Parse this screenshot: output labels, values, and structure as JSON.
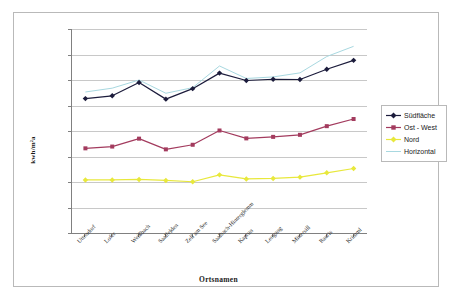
{
  "chart_data": {
    "type": "line",
    "title": "",
    "xlabel": "Ortsnamen",
    "ylabel": "kwh/m²a",
    "ylim": [
      0,
      800
    ],
    "ytick_step": 100,
    "yticks": [
      "0",
      "100",
      "200",
      "300",
      "400",
      "500",
      "600",
      "700",
      "800"
    ],
    "grid": true,
    "legend_position": "right",
    "categories": [
      "Uttendorf",
      "Lofer",
      "Weißbach",
      "Saalfelden",
      "Zell am See",
      "Saalbach-Hinterglemm",
      "Kaprun",
      "Leogang",
      "Mittersill",
      "Rauris",
      "Krimml"
    ],
    "series": [
      {
        "name": "Südfläche",
        "color": "#1c1c3c",
        "marker": "diamond",
        "values": [
          527,
          538,
          590,
          525,
          566,
          627,
          598,
          603,
          602,
          642,
          677
        ]
      },
      {
        "name": "Ost - West",
        "color": "#a33b5e",
        "marker": "square",
        "values": [
          332,
          339,
          370,
          328,
          346,
          402,
          371,
          377,
          385,
          419,
          447
        ]
      },
      {
        "name": "Nord",
        "color": "#e8e83c",
        "marker": "diamond",
        "values": [
          208,
          208,
          210,
          206,
          201,
          228,
          212,
          214,
          219,
          236,
          253
        ]
      },
      {
        "name": "Horizontal",
        "color": "#a8d8e0",
        "marker": "none",
        "values": [
          553,
          568,
          600,
          548,
          570,
          655,
          606,
          612,
          628,
          692,
          732
        ]
      }
    ]
  },
  "legend": {
    "entries": [
      {
        "label": "Südfläche"
      },
      {
        "label": "Ost - West"
      },
      {
        "label": "Nord"
      },
      {
        "label": "Horizontal"
      }
    ]
  },
  "colors": {
    "sudflache": "#1c1c3c",
    "ost_west": "#a33b5e",
    "nord": "#e8e83c",
    "horizontal": "#a8d8e0",
    "gridline": "#c8c8c8",
    "axis": "#808080",
    "frame": "#b9b9b9"
  }
}
